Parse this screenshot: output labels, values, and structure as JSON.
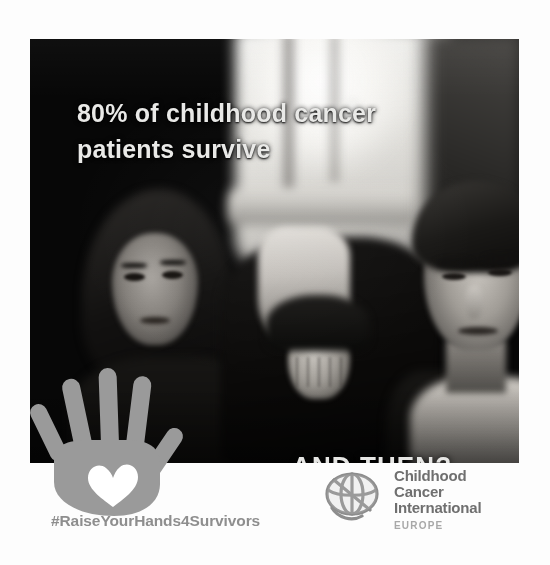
{
  "poster": {
    "type": "awareness-campaign-poster",
    "background_color": "#fdfdfd",
    "photo": {
      "description": "Black and white photo of two young people indoors in front of a bright window",
      "background_color": "#070707"
    },
    "headline": {
      "line1": "80% of childhood cancer",
      "line2": "patients survive",
      "full_text": "80% of childhood cancer\npatients survive",
      "color": "#e9e9e7"
    },
    "question": {
      "text": "AND THEN?",
      "color": "#e6e6e4"
    },
    "hand_icon": {
      "name": "raised-hand-with-heart",
      "color": "#9a9a9a",
      "heart_color": "#ffffff"
    },
    "hashtag": {
      "text": "#RaiseYourHands4Survivors",
      "color": "#8e8e8e"
    },
    "logo": {
      "mark": "globe-icon",
      "line1": "Childhood",
      "line2": "Cancer",
      "line3": "International",
      "region": "EUROPE",
      "text_color": "#6f6f6f",
      "region_color": "#a8a8a8"
    }
  }
}
